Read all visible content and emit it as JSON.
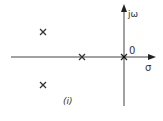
{
  "diagram": {
    "type": "pole-zero plot (s-plane)",
    "caption": "(i)",
    "axes": {
      "imaginary_label": "jω",
      "real_label": "σ",
      "origin_label": "0"
    },
    "poles": [
      {
        "symbol": "×",
        "position": "upper-left, complex pole"
      },
      {
        "symbol": "×",
        "position": "lower-left, complex conjugate pole"
      },
      {
        "symbol": "×",
        "position": "on negative real axis"
      },
      {
        "symbol": "×",
        "position": "at origin"
      }
    ],
    "colors": {
      "axis": "#333333",
      "pole": "#333333",
      "background": "#ffffff"
    }
  }
}
